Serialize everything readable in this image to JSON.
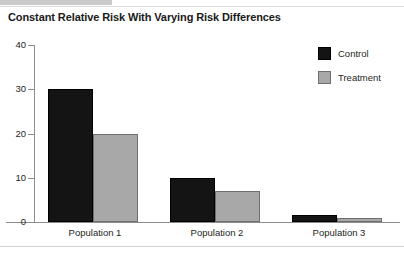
{
  "header": {
    "title": "Constant Relative Risk With Varying Risk Differences"
  },
  "chart_data": {
    "type": "bar",
    "title": "Constant Relative Risk With Varying Risk Differences",
    "xlabel": "",
    "ylabel": "",
    "categories": [
      "Population 1",
      "Population 2",
      "Population 3"
    ],
    "series": [
      {
        "name": "Control",
        "color": "#141414",
        "values": [
          30,
          10,
          1.5
        ]
      },
      {
        "name": "Treatment",
        "color": "#a8a8a8",
        "values": [
          20,
          7,
          1
        ]
      }
    ],
    "ylim": [
      0,
      40
    ],
    "yticks": [
      0,
      10,
      20,
      30,
      40
    ],
    "ytick_labels": [
      "0",
      "10",
      "20",
      "30",
      "40"
    ],
    "grid": false,
    "legend_position": "top-right",
    "legend": [
      {
        "label": "Control",
        "color": "#141414"
      },
      {
        "label": "Treatment",
        "color": "#a8a8a8"
      }
    ]
  }
}
